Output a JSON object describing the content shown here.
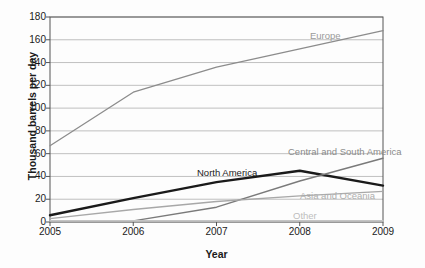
{
  "chart_data": {
    "type": "line",
    "title": "",
    "xlabel": "Year",
    "ylabel": "Thousand barrels per day",
    "categories": [
      "2005",
      "2006",
      "2007",
      "2008",
      "2009"
    ],
    "x": [
      2005,
      2006,
      2007,
      2008,
      2009
    ],
    "ylim": [
      0,
      180
    ],
    "yticks": [
      0,
      20,
      40,
      60,
      80,
      100,
      120,
      140,
      160,
      180
    ],
    "grid": "horizontal",
    "legend_position": "inline-labels",
    "series": [
      {
        "name": "Europe",
        "values": [
          67,
          114,
          136,
          152,
          168
        ],
        "color": "#8c8c8c",
        "width": 1.3,
        "label_x": 310,
        "label_y": 30,
        "label_color": "#9a9a9a"
      },
      {
        "name": "North America",
        "values": [
          6,
          21,
          35,
          45,
          32
        ],
        "color": "#1a1a1a",
        "width": 2.4,
        "label_x": 197,
        "label_y": 167,
        "label_color": "#1a1a1a"
      },
      {
        "name": "Central and South America",
        "values": [
          1,
          1,
          13,
          36,
          56
        ],
        "color": "#7a7a7a",
        "width": 1.4,
        "label_x": 288,
        "label_y": 146,
        "label_color": "#8a8a8a"
      },
      {
        "name": "Asia and Oceania",
        "values": [
          3,
          11,
          18,
          23,
          27
        ],
        "color": "#a8a8a8",
        "width": 1.3,
        "label_x": 300,
        "label_y": 190,
        "label_color": "#aeaeae"
      },
      {
        "name": "Other",
        "values": [
          1,
          1,
          1,
          1,
          1
        ],
        "color": "#c4c4c4",
        "width": 1.6,
        "label_x": 293,
        "label_y": 210,
        "label_color": "#bdbdbd"
      }
    ]
  },
  "axes": {
    "ytick_labels": [
      "180",
      "160",
      "140",
      "120",
      "100",
      "80",
      "60",
      "40",
      "20",
      "0"
    ],
    "xtick_labels": [
      "2005",
      "2006",
      "2007",
      "2008",
      "2009"
    ]
  },
  "colors": {
    "grid": "#b9b9b9",
    "frame": "#555555",
    "text": "#1a1a1a",
    "background": "#fdfdfd"
  }
}
